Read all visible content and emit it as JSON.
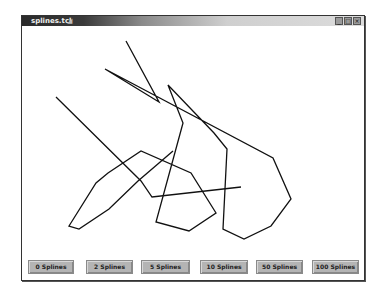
{
  "window": {
    "title": "splines.tcl",
    "controls": {
      "minimize": "_",
      "maximize": "□",
      "close": "×"
    }
  },
  "canvas": {
    "stroke_color": "#111111",
    "polyline": [
      [
        104,
        43
      ],
      [
        137,
        76
      ],
      [
        83,
        43
      ],
      [
        102,
        63
      ],
      [
        137,
        76
      ],
      [
        119,
        69
      ],
      [
        86,
        93
      ],
      [
        82,
        145
      ],
      [
        139,
        163
      ],
      [
        219,
        161
      ],
      [
        204,
        123
      ],
      [
        182,
        115
      ],
      [
        152,
        127
      ],
      [
        119,
        170
      ],
      [
        34,
        71
      ],
      [
        119,
        69
      ],
      [
        141,
        122
      ],
      [
        121,
        152
      ],
      [
        104,
        43
      ]
    ],
    "polyline_main": [
      [
        104,
        15
      ],
      [
        137,
        76
      ],
      [
        83,
        43
      ],
      [
        251,
        132
      ],
      [
        269,
        173
      ],
      [
        249,
        200
      ],
      [
        222,
        213
      ],
      [
        201,
        203
      ],
      [
        205,
        123
      ],
      [
        192,
        107
      ],
      [
        146,
        59
      ],
      [
        161,
        97
      ],
      [
        134,
        196
      ],
      [
        167,
        205
      ],
      [
        194,
        187
      ],
      [
        169,
        147
      ],
      [
        119,
        125
      ],
      [
        86,
        147
      ],
      [
        74,
        157
      ],
      [
        47,
        200
      ],
      [
        57,
        203
      ],
      [
        87,
        183
      ],
      [
        116,
        155
      ],
      [
        151,
        125
      ]
    ]
  },
  "buttons": [
    {
      "label": "0 Splines"
    },
    {
      "label": "2 Splines"
    },
    {
      "label": "5 Splines"
    },
    {
      "label": "10 Splines"
    },
    {
      "label": "50 Splines"
    },
    {
      "label": "100 Splines"
    }
  ]
}
